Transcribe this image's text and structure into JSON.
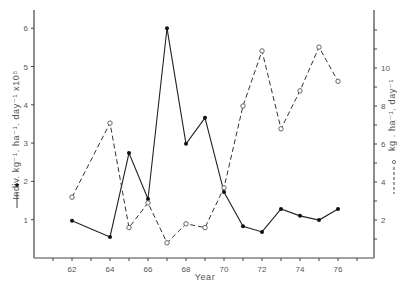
{
  "chart_data": {
    "type": "line",
    "title": "",
    "xlabel": "Year",
    "ylabel_left": "Indiv. kg⁻¹. ha⁻¹. day⁻¹  x10⁵",
    "ylabel_right": "kg . ha⁻¹. day⁻¹",
    "x_ticks": [
      62,
      64,
      66,
      68,
      70,
      72,
      74,
      76
    ],
    "x_range": [
      61,
      77
    ],
    "y_left_ticks": [
      1,
      2,
      3,
      4,
      5,
      6
    ],
    "y_left_range": [
      0,
      6.4
    ],
    "y_right_ticks": [
      2,
      4,
      6,
      8,
      10
    ],
    "y_right_range": [
      0,
      12.8
    ],
    "grid": false,
    "legend_position": "inline with axis titles (left: solid line with filled dot; right: dashed line with open circle)",
    "series": [
      {
        "name": "Indiv. kg⁻¹. ha⁻¹. day⁻¹ x10⁵",
        "axis": "left",
        "style": "solid",
        "marker": "filled-circle",
        "x": [
          62,
          64,
          65,
          66,
          67,
          68,
          69,
          70,
          71,
          72,
          73,
          74,
          75,
          76
        ],
        "values": [
          0.97,
          0.55,
          2.74,
          1.54,
          6.0,
          2.98,
          3.66,
          1.72,
          0.83,
          0.68,
          1.28,
          1.1,
          0.99,
          1.28
        ]
      },
      {
        "name": "kg . ha⁻¹. day⁻¹",
        "axis": "right",
        "style": "dashed",
        "marker": "open-circle",
        "x": [
          62,
          64,
          65,
          66,
          67,
          68,
          69,
          70,
          71,
          72,
          73,
          74,
          75,
          76
        ],
        "values": [
          3.2,
          7.1,
          1.6,
          2.9,
          0.8,
          1.8,
          1.6,
          3.7,
          8.0,
          10.9,
          6.8,
          8.8,
          11.1,
          9.3
        ]
      }
    ]
  },
  "labels": {
    "xlabel": "Year",
    "left_axis_title": "Indiv. kg⁻¹. ha⁻¹. day⁻¹  x10⁵",
    "right_axis_title": "kg . ha⁻¹. day⁻¹"
  }
}
